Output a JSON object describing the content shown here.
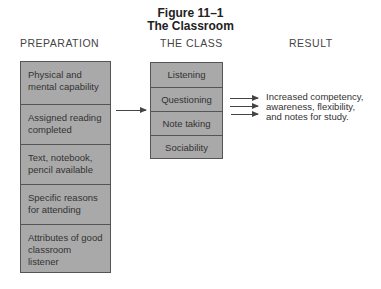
{
  "figure": {
    "number": "Figure 11–1",
    "title": "The Classroom"
  },
  "columns": {
    "preparation": "PREPARATION",
    "the_class": "THE CLASS",
    "result": "RESULT"
  },
  "preparation_items": [
    "Physical and mental capability",
    "Assigned reading completed",
    "Text, notebook, pencil available",
    "Specific reasons for attending",
    "Attributes of good classroom listener"
  ],
  "class_items": [
    "Listening",
    "Questioning",
    "Note taking",
    "Sociability"
  ],
  "result_lines": [
    "Increased competency,",
    "awareness, flexibility,",
    "and notes for study."
  ],
  "colors": {
    "box_fill": "#a9a9a9",
    "box_border": "#555555",
    "text": "#333333"
  }
}
